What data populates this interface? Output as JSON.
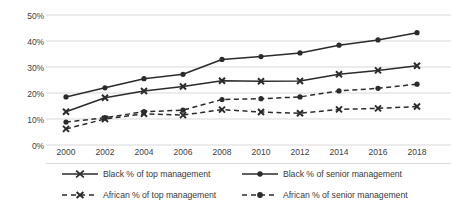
{
  "chart_data": {
    "type": "line",
    "title": "",
    "xlabel": "",
    "ylabel": "",
    "categories": [
      "2000",
      "2002",
      "2004",
      "2006",
      "2008",
      "2010",
      "2012",
      "2014",
      "2016",
      "2018"
    ],
    "x": [
      2000,
      2002,
      2004,
      2006,
      2008,
      2010,
      2012,
      2014,
      2016,
      2018
    ],
    "ylim": [
      0,
      50
    ],
    "ytick_values": [
      0,
      10,
      20,
      30,
      40,
      50
    ],
    "ytick_labels": [
      "0%",
      "10%",
      "20%",
      "30%",
      "40%",
      "50%"
    ],
    "grid": "horizontal",
    "legend_position": "bottom",
    "series": [
      {
        "name": "Black % of top management",
        "values": [
          12.8,
          18.2,
          20.8,
          22.5,
          24.7,
          24.5,
          24.6,
          27.2,
          28.7,
          30.5
        ],
        "line_style": "solid",
        "marker": "x",
        "color": "#2b2b2b"
      },
      {
        "name": "Black % of senior management",
        "values": [
          18.5,
          22.0,
          25.5,
          27.2,
          32.9,
          34.0,
          35.4,
          38.4,
          40.4,
          43.2
        ],
        "line_style": "solid",
        "marker": "circle",
        "color": "#2b2b2b"
      },
      {
        "name": "African % of top management",
        "values": [
          6.2,
          10.0,
          12.0,
          11.5,
          13.6,
          12.7,
          12.2,
          13.7,
          14.1,
          14.8
        ],
        "line_style": "dashed",
        "marker": "x",
        "color": "#2b2b2b"
      },
      {
        "name": "African % of senior management",
        "values": [
          8.8,
          10.5,
          12.8,
          13.4,
          17.5,
          17.8,
          18.5,
          20.8,
          21.8,
          23.4
        ],
        "line_style": "dashed",
        "marker": "circle",
        "color": "#2b2b2b"
      }
    ]
  },
  "axis": {
    "ytick_labels": [
      "50%",
      "40%",
      "30%",
      "20%",
      "10%",
      "0%"
    ],
    "xtick_labels": [
      "2000",
      "2002",
      "2004",
      "2006",
      "2008",
      "2010",
      "2012",
      "2014",
      "2016",
      "2018"
    ]
  },
  "legend": {
    "entries": [
      {
        "label": "Black % of top management",
        "style": "solid",
        "marker": "x"
      },
      {
        "label": "Black % of senior management",
        "style": "solid",
        "marker": "circle"
      },
      {
        "label": "African % of top management",
        "style": "dashed",
        "marker": "x"
      },
      {
        "label": "African % of senior management",
        "style": "dashed",
        "marker": "circle"
      }
    ]
  },
  "style": {
    "line_color": "#2b2b2b",
    "grid_color": "#d9d9d9",
    "text_color": "#404040",
    "background": "#ffffff"
  }
}
